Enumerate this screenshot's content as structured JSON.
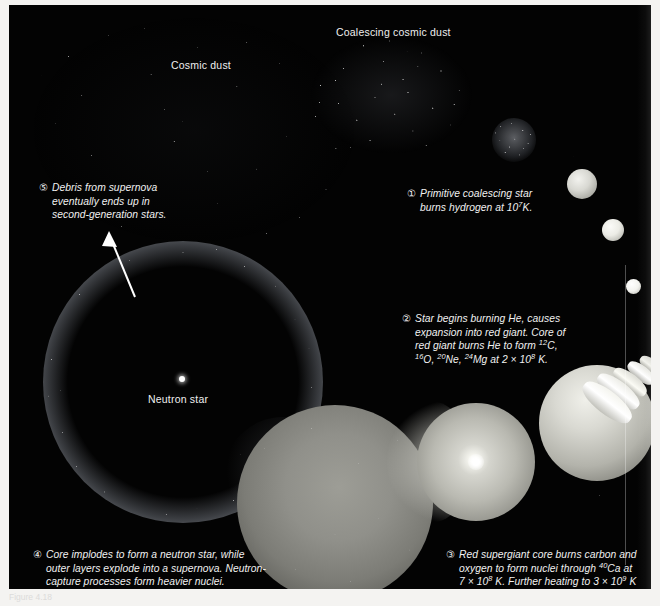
{
  "figure": {
    "background_color": "#030303",
    "text_color": "#f1f1f1",
    "caption_strip": "Figure 4.18"
  },
  "labels": {
    "cosmic_dust": "Cosmic dust",
    "coalescing_cosmic_dust": "Coalescing cosmic dust",
    "neutron_star": "Neutron star"
  },
  "captions": [
    {
      "marker": "①",
      "number": 1,
      "lines": [
        "Primitive coalescing star",
        "burns hydrogen at 10⁷K."
      ],
      "text": "Primitive coalescing star burns hydrogen at 10^7 K."
    },
    {
      "marker": "②",
      "number": 2,
      "lines": [
        "Star begins burning He, causes",
        "expansion into red giant. Core of",
        "red giant burns He to form ¹²C,",
        "¹⁶O, ²⁰Ne, ²⁴Mg at 2 × 10⁸ K."
      ],
      "text": "Star begins burning He, causes expansion into red giant. Core of red giant burns He to form 12C, 16O, 20Ne, 24Mg at 2 x 10^8 K."
    },
    {
      "marker": "③",
      "number": 3,
      "lines": [
        "Red supergiant core burns carbon and",
        "oxygen to form nuclei through ⁴⁰Ca at",
        "7 × 10⁸ K. Further heating to 3 × 10⁹ K",
        "forms nuclei through ⁵⁶Fe and ⁵⁸Ni."
      ],
      "text": "Red supergiant core burns carbon and oxygen to form nuclei through 40Ca at 7 x 10^8 K. Further heating to 3 x 10^9 K forms nuclei through 56Fe and 58Ni."
    },
    {
      "marker": "④",
      "number": 4,
      "lines": [
        "Core implodes to form a neutron star, while",
        "outer layers explode into a supernova. Neutron-",
        "capture processes form heavier nuclei."
      ],
      "text": "Core implodes to form a neutron star, while outer layers explode into a supernova. Neutron-capture processes form heavier nuclei."
    },
    {
      "marker": "⑤",
      "number": 5,
      "lines": [
        "Debris from supernova",
        "eventually ends up in",
        "second-generation stars."
      ],
      "text": "Debris from supernova eventually ends up in second-generation stars."
    }
  ],
  "objects": {
    "cosmic_dust_cloud": "diffuse-dust-field",
    "coalescing_dust_cloud": "dense-dust-cloud",
    "protostar": "granular-protostar",
    "main_sequence_stars": [
      "star-large",
      "star-medium",
      "star-small"
    ],
    "onion_shell": "layered-shell-structure",
    "supergiant": "supergiant-sphere",
    "red_giant": "red-giant-sphere-with-core",
    "expanding_envelope": "grainy-expanding-sphere",
    "supernova_remnant": "glowing-ring",
    "neutron_star_point": "white-point-source",
    "arrow": "debris-recycle-arrow"
  }
}
